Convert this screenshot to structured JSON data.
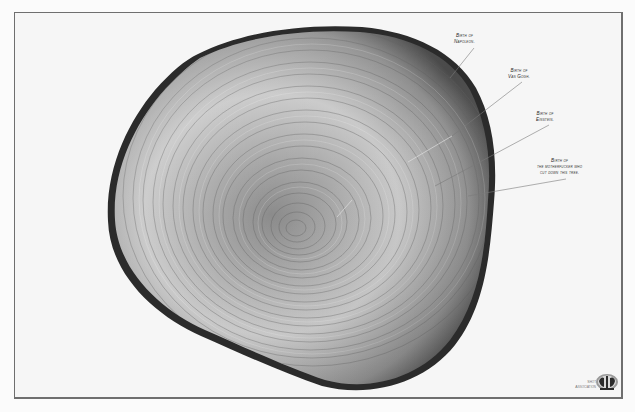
{
  "frame": {
    "border_color": "#6f6f6f",
    "background": "#f6f6f6"
  },
  "colors": {
    "bark": "#2b2b2b",
    "wood_light": "#d6d6d6",
    "wood_mid": "#9a9a9a",
    "wood_dark": "#6b6b6b",
    "line": "#7a7a7a",
    "text": "#2a2a2a"
  },
  "annotations": [
    {
      "id": "napoleon",
      "line1": "Birth of",
      "line2": "Napoleon."
    },
    {
      "id": "van-gogh",
      "line1": "Birth of",
      "line2": "Van Gogh."
    },
    {
      "id": "einstein",
      "line1": "Birth of",
      "line2": "Einstein."
    },
    {
      "id": "cutter",
      "line1": "Birth of",
      "line2": "the motherfucker who",
      "line3": "cut down this tree."
    }
  ],
  "logo": {
    "line1": "Shot",
    "line2": "Association",
    "icon": "organization-logo-icon"
  },
  "image": {
    "subject": "tree-ring-cross-section-icon"
  }
}
